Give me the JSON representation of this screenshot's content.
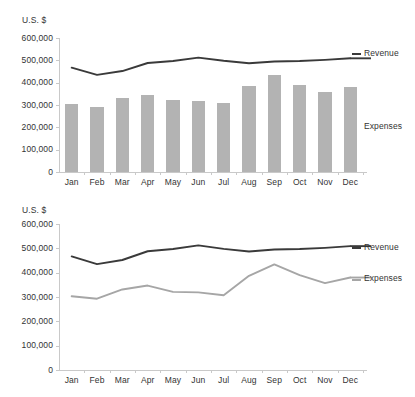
{
  "chart_data": [
    {
      "type": "bar",
      "id": "top",
      "title": "",
      "ylabel": "U.S. $",
      "xlabel": "",
      "grid": false,
      "legend_position": "right-inline",
      "ylim": [
        0,
        600000
      ],
      "yticks": [
        "0",
        "100,000",
        "200,000",
        "300,000",
        "400,000",
        "500,000",
        "600,000"
      ],
      "ytick_values": [
        0,
        100000,
        200000,
        300000,
        400000,
        500000,
        600000
      ],
      "categories": [
        "Jan",
        "Feb",
        "Mar",
        "Apr",
        "May",
        "Jun",
        "Jul",
        "Aug",
        "Sep",
        "Oct",
        "Nov",
        "Dec"
      ],
      "series": [
        {
          "name": "Expenses",
          "render": "bar",
          "color": "#b3b3b3",
          "values": [
            303000,
            293000,
            331000,
            347000,
            321000,
            319000,
            307000,
            387000,
            434000,
            390000,
            357000,
            380000
          ]
        },
        {
          "name": "Revenue",
          "render": "line",
          "color": "#3a3a3a",
          "values": [
            467000,
            435000,
            452000,
            488000,
            497000,
            512000,
            498000,
            487000,
            495000,
            497000,
            502000,
            509000
          ]
        }
      ]
    },
    {
      "type": "line",
      "id": "bottom",
      "title": "",
      "ylabel": "U.S. $",
      "xlabel": "",
      "grid": false,
      "legend_position": "right-inline",
      "ylim": [
        0,
        600000
      ],
      "yticks": [
        "0",
        "100,000",
        "200,000",
        "300,000",
        "400,000",
        "500,000",
        "600,000"
      ],
      "ytick_values": [
        0,
        100000,
        200000,
        300000,
        400000,
        500000,
        600000
      ],
      "categories": [
        "Jan",
        "Feb",
        "Mar",
        "Apr",
        "May",
        "Jun",
        "Jul",
        "Aug",
        "Sep",
        "Oct",
        "Nov",
        "Dec"
      ],
      "series": [
        {
          "name": "Revenue",
          "render": "line",
          "color": "#3a3a3a",
          "values": [
            467000,
            435000,
            452000,
            488000,
            497000,
            512000,
            498000,
            487000,
            495000,
            497000,
            502000,
            509000
          ]
        },
        {
          "name": "Expenses",
          "render": "line",
          "color": "#a6a6a6",
          "values": [
            303000,
            293000,
            331000,
            347000,
            321000,
            319000,
            307000,
            387000,
            434000,
            390000,
            357000,
            380000
          ]
        }
      ]
    }
  ],
  "top_chart": {
    "axis_title": "U.S. $",
    "yticks": [
      "600,000",
      "500,000",
      "400,000",
      "300,000",
      "200,000",
      "100,000",
      "0"
    ],
    "xticks": [
      "Jan",
      "Feb",
      "Mar",
      "Apr",
      "May",
      "Jun",
      "Jul",
      "Aug",
      "Sep",
      "Oct",
      "Nov",
      "Dec"
    ],
    "legend": {
      "revenue": "Revenue",
      "expenses": "Expenses"
    }
  },
  "bottom_chart": {
    "axis_title": "U.S. $",
    "yticks": [
      "600,000",
      "500,000",
      "400,000",
      "300,000",
      "200,000",
      "100,000",
      "0"
    ],
    "xticks": [
      "Jan",
      "Feb",
      "Mar",
      "Apr",
      "May",
      "Jun",
      "Jul",
      "Aug",
      "Sep",
      "Oct",
      "Nov",
      "Dec"
    ],
    "legend": {
      "revenue": "Revenue",
      "expenses": "Expenses"
    }
  },
  "colors": {
    "bar_fill": "#b3b3b3",
    "revenue_line": "#3a3a3a",
    "expenses_line": "#a6a6a6",
    "axis": "#c9c9c9",
    "text": "#333333",
    "background": "#ffffff"
  }
}
